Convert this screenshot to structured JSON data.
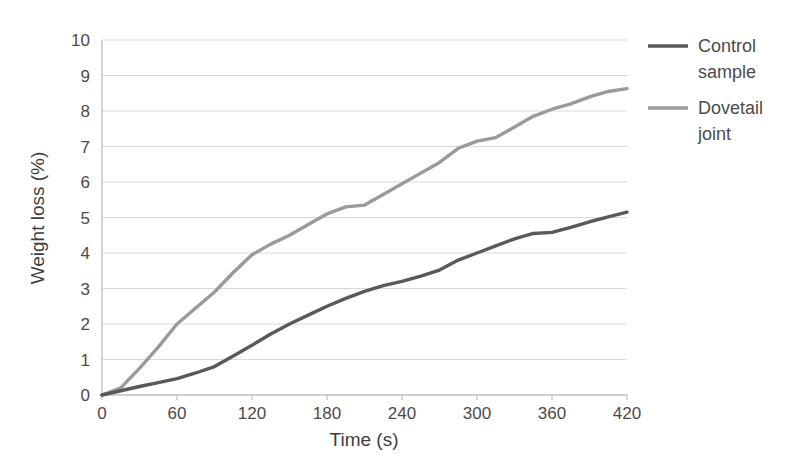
{
  "chart_data": {
    "type": "line",
    "title": "",
    "xlabel": "Time (s)",
    "ylabel": "Weight loss (%)",
    "xlim": [
      0,
      420
    ],
    "ylim": [
      0,
      10
    ],
    "xticks": [
      0,
      60,
      120,
      180,
      240,
      300,
      360,
      420
    ],
    "yticks": [
      0,
      1,
      2,
      3,
      4,
      5,
      6,
      7,
      8,
      9,
      10
    ],
    "grid": "horizontal",
    "legend_position": "right",
    "series": [
      {
        "name": "Control sample",
        "color": "#595959",
        "x": [
          0,
          15,
          30,
          45,
          60,
          75,
          90,
          105,
          120,
          135,
          150,
          165,
          180,
          195,
          210,
          225,
          240,
          255,
          270,
          285,
          300,
          315,
          330,
          345,
          360,
          375,
          390,
          405,
          420
        ],
        "y": [
          0.0,
          0.12,
          0.24,
          0.35,
          0.46,
          0.62,
          0.8,
          1.1,
          1.4,
          1.72,
          2.0,
          2.25,
          2.5,
          2.72,
          2.92,
          3.08,
          3.2,
          3.35,
          3.52,
          3.8,
          4.0,
          4.2,
          4.4,
          4.55,
          4.58,
          4.72,
          4.88,
          5.02,
          5.15
        ]
      },
      {
        "name": "Dovetail joint",
        "color": "#9a9a9a",
        "x": [
          0,
          15,
          30,
          45,
          60,
          75,
          90,
          105,
          120,
          135,
          150,
          165,
          180,
          195,
          210,
          225,
          240,
          255,
          270,
          285,
          300,
          315,
          330,
          345,
          360,
          375,
          390,
          405,
          420
        ],
        "y": [
          0.0,
          0.2,
          0.75,
          1.35,
          2.0,
          2.45,
          2.9,
          3.45,
          3.95,
          4.25,
          4.5,
          4.8,
          5.1,
          5.3,
          5.35,
          5.65,
          5.95,
          6.25,
          6.55,
          6.95,
          7.15,
          7.25,
          7.55,
          7.85,
          8.05,
          8.2,
          8.4,
          8.55,
          8.63
        ]
      }
    ]
  },
  "legend": {
    "entries": [
      {
        "label_line1": "Control",
        "label_line2": "sample",
        "color": "#595959"
      },
      {
        "label_line1": "Dovetail",
        "label_line2": "joint",
        "color": "#9a9a9a"
      }
    ]
  },
  "axes": {
    "x_title": "Time (s)",
    "y_title": "Weight loss (%)",
    "x_tick_labels": [
      "0",
      "60",
      "120",
      "180",
      "240",
      "300",
      "360",
      "420"
    ],
    "y_tick_labels": [
      "0",
      "1",
      "2",
      "3",
      "4",
      "5",
      "6",
      "7",
      "8",
      "9",
      "10"
    ]
  }
}
